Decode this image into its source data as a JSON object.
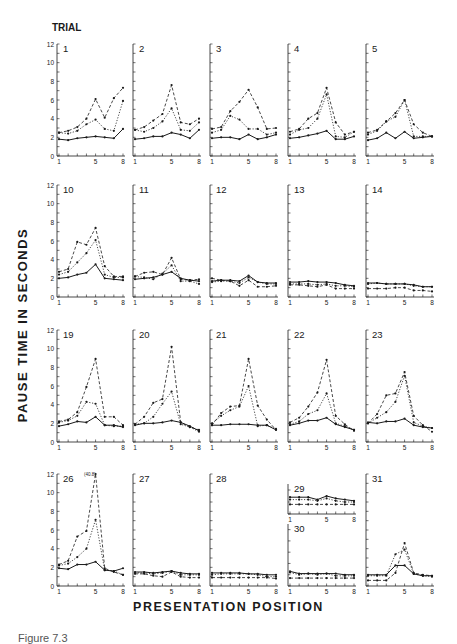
{
  "figure": {
    "trial_label": "TRIAL",
    "y_axis_label": "PAUSE TIME IN SECONDS",
    "x_axis_label": "PRESENTATION POSITION",
    "caption": "Figure 7.3"
  },
  "chart_data": {
    "type": "line",
    "xlabel": "PRESENTATION POSITION",
    "ylabel": "PAUSE TIME IN SECONDS",
    "ylim": [
      0,
      12
    ],
    "xlim": [
      1,
      8
    ],
    "x": [
      1,
      2,
      3,
      4,
      5,
      6,
      7,
      8
    ],
    "y_ticks": [
      0,
      2,
      4,
      6,
      8,
      10,
      12
    ],
    "x_tick_labels": [
      "1",
      "5",
      "8"
    ],
    "grid": false,
    "series_styles": [
      "solid",
      "dotted",
      "dashed"
    ],
    "annotations": [
      {
        "panel": "26",
        "text": "(40.8)",
        "note": "off-scale value at position 5"
      }
    ],
    "panels": [
      {
        "trial": "1",
        "row": 1,
        "series": [
          [
            1.8,
            1.7,
            1.9,
            2.0,
            2.1,
            2.0,
            1.9,
            2.9
          ],
          [
            2.5,
            2.4,
            2.7,
            3.4,
            3.9,
            2.9,
            2.7,
            5.9
          ],
          [
            2.5,
            2.7,
            3.1,
            4.0,
            6.1,
            4.1,
            6.2,
            7.3
          ]
        ]
      },
      {
        "trial": "2",
        "row": 1,
        "series": [
          [
            1.8,
            1.9,
            2.1,
            2.1,
            2.5,
            2.3,
            1.9,
            2.8
          ],
          [
            2.8,
            2.6,
            3.0,
            3.7,
            5.1,
            2.8,
            2.7,
            3.6
          ],
          [
            2.8,
            3.1,
            3.8,
            4.5,
            7.6,
            3.6,
            3.4,
            4.0
          ]
        ]
      },
      {
        "trial": "3",
        "row": 1,
        "series": [
          [
            1.9,
            2.0,
            2.0,
            1.8,
            2.3,
            1.8,
            2.0,
            2.3
          ],
          [
            2.5,
            2.8,
            4.3,
            3.9,
            2.9,
            2.9,
            2.3,
            2.5
          ],
          [
            2.9,
            3.1,
            4.8,
            5.8,
            7.1,
            5.2,
            2.9,
            3.0
          ]
        ]
      },
      {
        "trial": "4",
        "row": 1,
        "series": [
          [
            1.9,
            2.0,
            2.2,
            2.4,
            2.7,
            1.8,
            1.8,
            2.1
          ],
          [
            2.3,
            2.8,
            3.0,
            4.0,
            6.6,
            2.1,
            2.0,
            2.6
          ],
          [
            2.6,
            2.9,
            4.0,
            4.6,
            7.3,
            3.6,
            2.3,
            2.6
          ]
        ]
      },
      {
        "trial": "5",
        "row": 1,
        "series": [
          [
            1.7,
            1.9,
            2.5,
            1.9,
            2.6,
            1.9,
            2.0,
            2.1
          ],
          [
            2.3,
            2.7,
            3.7,
            4.2,
            6.0,
            2.1,
            2.1,
            2.1
          ],
          [
            2.5,
            2.8,
            3.7,
            4.6,
            6.0,
            3.4,
            2.5,
            2.1
          ]
        ]
      },
      {
        "trial": "10",
        "row": 2,
        "series": [
          [
            2.0,
            2.1,
            2.4,
            2.6,
            3.5,
            2.0,
            1.9,
            1.8
          ],
          [
            2.4,
            2.7,
            3.7,
            4.7,
            6.1,
            2.4,
            2.1,
            2.1
          ],
          [
            2.7,
            3.0,
            5.9,
            5.6,
            7.4,
            3.3,
            2.2,
            2.2
          ]
        ]
      },
      {
        "trial": "11",
        "row": 2,
        "series": [
          [
            1.9,
            2.0,
            2.1,
            2.4,
            2.7,
            2.0,
            1.8,
            1.7
          ],
          [
            2.2,
            2.1,
            1.9,
            2.5,
            3.4,
            1.7,
            1.7,
            1.4
          ],
          [
            2.2,
            2.6,
            2.7,
            2.4,
            4.2,
            1.9,
            1.8,
            1.9
          ]
        ]
      },
      {
        "trial": "12",
        "row": 2,
        "series": [
          [
            1.7,
            1.8,
            1.8,
            1.7,
            2.3,
            1.6,
            1.5,
            1.5
          ],
          [
            1.6,
            1.7,
            1.7,
            1.5,
            2.1,
            1.6,
            1.4,
            1.4
          ],
          [
            2.0,
            1.8,
            1.7,
            1.2,
            1.8,
            1.1,
            1.1,
            1.2
          ]
        ]
      },
      {
        "trial": "13",
        "row": 2,
        "series": [
          [
            1.6,
            1.6,
            1.7,
            1.6,
            1.6,
            1.5,
            1.3,
            1.2
          ],
          [
            1.4,
            1.4,
            1.4,
            1.3,
            1.4,
            1.2,
            1.2,
            1.1
          ],
          [
            1.3,
            1.3,
            1.2,
            1.1,
            1.3,
            0.9,
            0.9,
            0.9
          ]
        ]
      },
      {
        "trial": "14",
        "row": 2,
        "series": [
          [
            1.5,
            1.5,
            1.4,
            1.4,
            1.4,
            1.3,
            1.1,
            1.1
          ],
          [
            1.4,
            1.5,
            1.4,
            1.4,
            1.4,
            1.2,
            1.1,
            1.1
          ],
          [
            0.9,
            0.9,
            0.9,
            1.0,
            1.0,
            0.7,
            0.7,
            0.6
          ]
        ]
      },
      {
        "trial": "19",
        "row": 3,
        "series": [
          [
            1.7,
            1.9,
            2.2,
            2.1,
            2.7,
            1.8,
            1.8,
            1.6
          ],
          [
            2.1,
            2.3,
            2.8,
            4.3,
            4.1,
            1.8,
            1.7,
            1.7
          ],
          [
            2.2,
            2.4,
            3.2,
            5.9,
            8.9,
            2.7,
            2.7,
            1.8
          ]
        ]
      },
      {
        "trial": "20",
        "row": 3,
        "series": [
          [
            1.8,
            2.0,
            2.0,
            2.1,
            2.3,
            2.1,
            1.7,
            1.2
          ],
          [
            1.9,
            2.0,
            2.7,
            4.1,
            5.4,
            1.9,
            1.6,
            1.1
          ],
          [
            1.9,
            2.7,
            4.2,
            4.6,
            10.2,
            2.1,
            1.6,
            1.3
          ]
        ]
      },
      {
        "trial": "21",
        "row": 3,
        "series": [
          [
            1.8,
            1.8,
            1.9,
            1.9,
            1.9,
            1.8,
            1.8,
            1.3
          ],
          [
            2.0,
            2.8,
            3.4,
            3.8,
            6.0,
            1.7,
            1.8,
            1.4
          ],
          [
            1.8,
            3.1,
            3.8,
            3.9,
            8.9,
            3.9,
            2.4,
            1.3
          ]
        ]
      },
      {
        "trial": "22",
        "row": 3,
        "series": [
          [
            1.8,
            2.0,
            2.3,
            2.3,
            2.6,
            1.9,
            1.6,
            1.3
          ],
          [
            1.9,
            2.2,
            3.0,
            3.4,
            5.2,
            2.0,
            1.7,
            1.3
          ],
          [
            2.1,
            2.6,
            3.8,
            5.3,
            8.8,
            2.8,
            1.9,
            1.2
          ]
        ]
      },
      {
        "trial": "23",
        "row": 3,
        "series": [
          [
            2.1,
            2.0,
            2.2,
            2.2,
            2.5,
            1.8,
            1.6,
            1.5
          ],
          [
            2.0,
            2.6,
            3.2,
            4.3,
            7.1,
            2.1,
            1.7,
            1.5
          ],
          [
            2.0,
            3.0,
            5.0,
            5.2,
            7.5,
            2.8,
            1.8,
            1.1
          ]
        ]
      },
      {
        "trial": "26",
        "row": 4,
        "series": [
          [
            1.9,
            1.8,
            2.3,
            2.3,
            2.6,
            1.7,
            1.6,
            1.9
          ],
          [
            2.2,
            2.4,
            3.1,
            4.0,
            7.1,
            1.7,
            1.6,
            1.2
          ],
          [
            2.3,
            2.7,
            5.3,
            5.9,
            12.0,
            1.9,
            1.5,
            1.2
          ]
        ]
      },
      {
        "trial": "27",
        "row": 4,
        "series": [
          [
            1.5,
            1.5,
            1.4,
            1.5,
            1.6,
            1.4,
            1.3,
            1.3
          ],
          [
            1.4,
            1.4,
            1.3,
            1.4,
            1.6,
            1.2,
            1.2,
            1.2
          ],
          [
            1.3,
            1.3,
            1.1,
            1.0,
            1.5,
            1.0,
            0.9,
            0.9
          ]
        ]
      },
      {
        "trial": "28",
        "row": 4,
        "series": [
          [
            1.4,
            1.4,
            1.4,
            1.4,
            1.3,
            1.3,
            1.2,
            1.2
          ],
          [
            1.2,
            1.3,
            1.3,
            1.3,
            1.3,
            1.2,
            1.0,
            1.0
          ],
          [
            0.9,
            0.9,
            0.9,
            0.9,
            0.9,
            0.9,
            0.9,
            0.8
          ]
        ]
      },
      {
        "trial": "29",
        "row": 4,
        "inset": "upper",
        "series": [
          [
            1.4,
            1.4,
            1.4,
            1.2,
            1.5,
            1.3,
            1.2,
            1.1
          ],
          [
            1.2,
            1.2,
            1.2,
            1.1,
            1.3,
            1.1,
            1.0,
            1.0
          ],
          [
            0.8,
            0.8,
            0.8,
            0.8,
            0.8,
            0.8,
            0.8,
            0.8
          ]
        ]
      },
      {
        "trial": "30",
        "row": 4,
        "inset": "lower",
        "series": [
          [
            1.3,
            1.1,
            1.1,
            1.1,
            1.1,
            1.1,
            1.0,
            1.0
          ],
          [
            1.2,
            1.0,
            1.1,
            1.0,
            1.1,
            0.9,
            0.9,
            0.9
          ],
          [
            0.7,
            0.7,
            0.7,
            0.7,
            0.7,
            0.7,
            0.7,
            0.7
          ]
        ]
      },
      {
        "trial": "31",
        "row": 4,
        "series": [
          [
            1.2,
            1.2,
            1.2,
            2.2,
            2.2,
            1.3,
            1.1,
            1.1
          ],
          [
            1.1,
            1.1,
            1.1,
            3.4,
            3.9,
            1.3,
            1.1,
            1.0
          ],
          [
            0.6,
            0.6,
            0.6,
            1.4,
            4.6,
            1.4,
            1.2,
            1.1
          ]
        ]
      }
    ]
  },
  "colors": {
    "ink": "#1a1a1a",
    "background": "#ffffff"
  }
}
